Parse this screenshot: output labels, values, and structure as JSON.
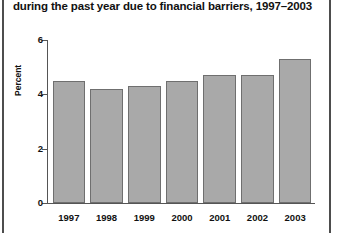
{
  "figure": {
    "title": "during the past year due to financial barriers, 1997–2003",
    "bar_fill": "#a9a9a9",
    "bar_stroke": "#6f6f6f",
    "axis_color": "#555555",
    "text_color": "#111111"
  },
  "chart_data": {
    "type": "bar",
    "title": "during the past year due to financial barriers, 1997–2003",
    "xlabel": "",
    "ylabel": "Percent",
    "categories": [
      "1997",
      "1998",
      "1999",
      "2000",
      "2001",
      "2002",
      "2003"
    ],
    "values": [
      4.5,
      4.2,
      4.3,
      4.5,
      4.7,
      4.7,
      5.3
    ],
    "ylim": [
      0,
      6
    ],
    "yticks": [
      0,
      2,
      4,
      6
    ],
    "ytick_labels": [
      "0",
      "2",
      "4",
      "6"
    ],
    "grid": false,
    "legend": null
  }
}
